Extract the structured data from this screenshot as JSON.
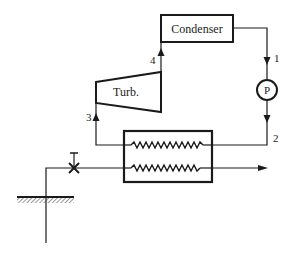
{
  "diagram": {
    "type": "geothermal binary power cycle schematic",
    "components": {
      "condenser": {
        "label": "Condenser"
      },
      "turbine": {
        "label": "Turb."
      },
      "pump": {
        "label": "P"
      },
      "heat_exchanger": {
        "label": ""
      },
      "valve": {
        "label": ""
      },
      "ground": {
        "label": ""
      }
    },
    "state_points": {
      "p1": "1",
      "p2": "2",
      "p3": "3",
      "p4": "4"
    },
    "colors": {
      "line": "#1a1a1a",
      "background": "#ffffff"
    }
  }
}
